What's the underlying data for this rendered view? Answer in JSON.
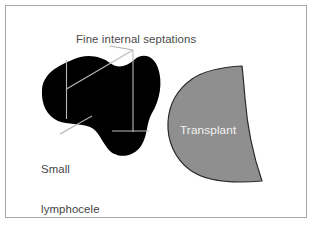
{
  "figure": {
    "background_color": "#ffffff",
    "border_color": "#a8a8a8"
  },
  "labels": {
    "septations": "Fine internal septations",
    "lymphocele_line1": "Small",
    "lymphocele_line2": "lymphocele",
    "transplant": "Transplant"
  },
  "shapes": {
    "lymphocele": {
      "name": "lymphocele-blob",
      "fill": "#000000",
      "description": "bilobed fluid collection"
    },
    "transplant": {
      "name": "transplant-kidney",
      "fill": "#8f8f8f",
      "stroke": "#2b2b2b",
      "description": "D-shaped transplanted kidney"
    },
    "septations": {
      "name": "internal-septations",
      "stroke": "#b9b9b9",
      "count": 4
    },
    "leader_lines": {
      "name": "leader-lines",
      "stroke": "#b0b0b0"
    }
  },
  "colors": {
    "black": "#000000",
    "gray_fill": "#8f8f8f",
    "outline": "#2b2b2b",
    "septation": "#b9b9b9",
    "text_dark": "#4a4a4a",
    "text_light": "#f2f2f2",
    "frame": "#a8a8a8"
  }
}
